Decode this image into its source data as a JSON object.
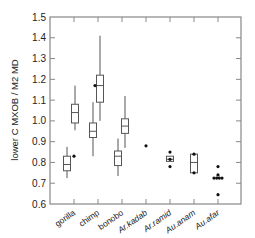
{
  "chart_data": {
    "type": "box",
    "title": "",
    "xlabel": "",
    "ylabel": "lower C MXOB / M2 MD",
    "ylim": [
      0.6,
      1.5
    ],
    "yticks": [
      "0.6",
      "0.7",
      "0.8",
      "0.9",
      "1.0",
      "1.1",
      "1.2",
      "1.3",
      "1.4",
      "1.5"
    ],
    "grid": false,
    "legend": null,
    "categories": [
      "gorilla",
      "chimp",
      "bonobo",
      "Ar.kadab",
      "Ar.ramid",
      "Au.anam",
      "Au.afar"
    ],
    "category_italic": [
      false,
      false,
      false,
      true,
      true,
      true,
      true
    ],
    "boxes": [
      {
        "category": "gorilla",
        "offset": -7,
        "whisker_low": 0.725,
        "q1": 0.76,
        "median": 0.79,
        "q3": 0.83,
        "whisker_high": 0.875
      },
      {
        "category": "gorilla",
        "offset": 1,
        "whisker_low": 0.955,
        "q1": 0.99,
        "median": 1.04,
        "q3": 1.08,
        "whisker_high": 1.17
      },
      {
        "category": "chimp",
        "offset": -5,
        "whisker_low": 0.83,
        "q1": 0.92,
        "median": 0.95,
        "q3": 0.99,
        "whisker_high": 1.09
      },
      {
        "category": "chimp",
        "offset": 2,
        "whisker_low": 1.0,
        "q1": 1.09,
        "median": 1.17,
        "q3": 1.22,
        "whisker_high": 1.41
      },
      {
        "category": "bonobo",
        "offset": -4,
        "whisker_low": 0.735,
        "q1": 0.785,
        "median": 0.83,
        "q3": 0.855,
        "whisker_high": 0.915
      },
      {
        "category": "bonobo",
        "offset": 3,
        "whisker_low": 0.87,
        "q1": 0.94,
        "median": 0.975,
        "q3": 1.01,
        "whisker_high": 1.12
      },
      {
        "category": "Ar.ramid",
        "offset": 0,
        "whisker_low": 0.805,
        "q1": 0.805,
        "median": 0.815,
        "q3": 0.83,
        "whisker_high": 0.83
      },
      {
        "category": "Au.anam",
        "offset": 0,
        "whisker_low": 0.75,
        "q1": 0.75,
        "median": 0.8,
        "q3": 0.84,
        "whisker_high": 0.84
      }
    ],
    "points": [
      {
        "category": "gorilla",
        "offset": 0,
        "y": 0.83
      },
      {
        "category": "chimp",
        "offset": -3,
        "y": 1.17
      },
      {
        "category": "Ar.kadab",
        "offset": 0,
        "y": 0.88
      },
      {
        "category": "Ar.ramid",
        "offset": 0,
        "y": 0.85
      },
      {
        "category": "Ar.ramid",
        "offset": 0,
        "y": 0.815
      },
      {
        "category": "Ar.ramid",
        "offset": 0,
        "y": 0.78
      },
      {
        "category": "Au.anam",
        "offset": 0,
        "y": 0.84
      },
      {
        "category": "Au.anam",
        "offset": 0,
        "y": 0.75
      },
      {
        "category": "Au.afar",
        "offset": 0,
        "y": 0.78
      },
      {
        "category": "Au.afar",
        "offset": 0,
        "y": 0.74
      },
      {
        "category": "Au.afar",
        "offset": -4,
        "y": 0.725
      },
      {
        "category": "Au.afar",
        "offset": -1.3,
        "y": 0.725
      },
      {
        "category": "Au.afar",
        "offset": 1.3,
        "y": 0.725
      },
      {
        "category": "Au.afar",
        "offset": 4,
        "y": 0.725
      },
      {
        "category": "Au.afar",
        "offset": 0,
        "y": 0.645
      }
    ]
  },
  "colors": {
    "axis": "#888888",
    "box": "#555555",
    "point": "#111111",
    "text": "#222222"
  }
}
